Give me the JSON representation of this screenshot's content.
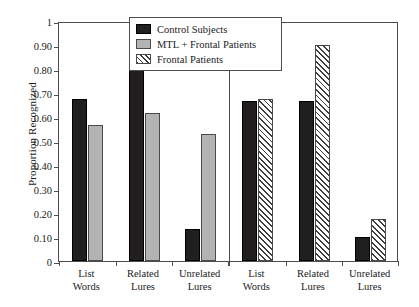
{
  "chart_data": {
    "type": "bar",
    "title": "",
    "xlabel": "",
    "ylabel": "Proportion Recognized",
    "ylim": [
      0,
      1
    ],
    "ytick_labels": [
      "1",
      "0.90",
      "0.80",
      "0.70",
      "0.60",
      "0.50",
      "0.40",
      "0.30",
      "0.20",
      "0.10",
      "0"
    ],
    "ytick_values": [
      1,
      0.9,
      0.8,
      0.7,
      0.6,
      0.5,
      0.4,
      0.3,
      0.2,
      0.1,
      0
    ],
    "grid": false,
    "legend_position": "top-center",
    "panels": [
      {
        "name": "left-panel",
        "categories": [
          "List Words",
          "Related Lures",
          "Unrelated Lures"
        ],
        "series": [
          {
            "name": "Control Subjects",
            "style": "control",
            "values": [
              0.675,
              0.805,
              0.135
            ]
          },
          {
            "name": "MTL + Frontal Patients",
            "style": "mtl",
            "values": [
              0.565,
              0.615,
              0.53
            ]
          }
        ]
      },
      {
        "name": "right-panel",
        "categories": [
          "List Words",
          "Related Lures",
          "Unrelated Lures"
        ],
        "series": [
          {
            "name": "Control Subjects",
            "style": "control",
            "values": [
              0.665,
              0.665,
              0.1
            ]
          },
          {
            "name": "Frontal Patients",
            "style": "frontal",
            "values": [
              0.675,
              0.9,
              0.175
            ]
          }
        ]
      }
    ],
    "legend": [
      {
        "label": "Control Subjects",
        "style": "control"
      },
      {
        "label": "MTL + Frontal Patients",
        "style": "mtl"
      },
      {
        "label": "Frontal Patients",
        "style": "frontal"
      }
    ]
  }
}
